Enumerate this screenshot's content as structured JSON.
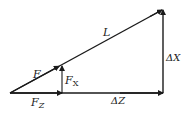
{
  "diagram": {
    "labels": {
      "hypotenuse": "L",
      "force": "F",
      "force_x_main": "F",
      "force_x_sub": "X",
      "force_z_main": "F",
      "force_z_sub": "Z",
      "delta_x": "ΔX",
      "delta_z": "ΔZ"
    },
    "colors": {
      "line": "#1a1a1a",
      "text": "#222222"
    }
  }
}
